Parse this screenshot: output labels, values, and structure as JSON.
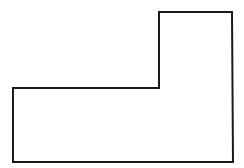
{
  "figure": {
    "shape": "L-shaped polygon outline",
    "stroke_color": "#1a1a1a",
    "fill_color": "#ffffff",
    "stroke_width": 2,
    "points": "13,88 159,88 159,12 232,12 233,162 13,162"
  }
}
